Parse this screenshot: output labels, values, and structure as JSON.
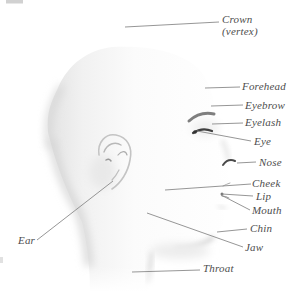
{
  "diagram": {
    "labels": [
      {
        "id": "crown",
        "text": "Crown",
        "text2": "(vertex)"
      },
      {
        "id": "forehead",
        "text": "Forehead"
      },
      {
        "id": "eyebrow",
        "text": "Eyebrow"
      },
      {
        "id": "eyelash",
        "text": "Eyelash"
      },
      {
        "id": "eye",
        "text": "Eye"
      },
      {
        "id": "nose",
        "text": "Nose"
      },
      {
        "id": "cheek",
        "text": "Cheek"
      },
      {
        "id": "lip",
        "text": "Lip"
      },
      {
        "id": "mouth",
        "text": "Mouth"
      },
      {
        "id": "chin",
        "text": "Chin"
      },
      {
        "id": "jaw",
        "text": "Jaw"
      },
      {
        "id": "ear",
        "text": "Ear"
      },
      {
        "id": "throat",
        "text": "Throat"
      }
    ],
    "colors": {
      "background": "#ffffff",
      "label_text": "#4d4d4d",
      "leader_line": "#8a8a8a",
      "head_shading": "#d9d9d9"
    }
  }
}
